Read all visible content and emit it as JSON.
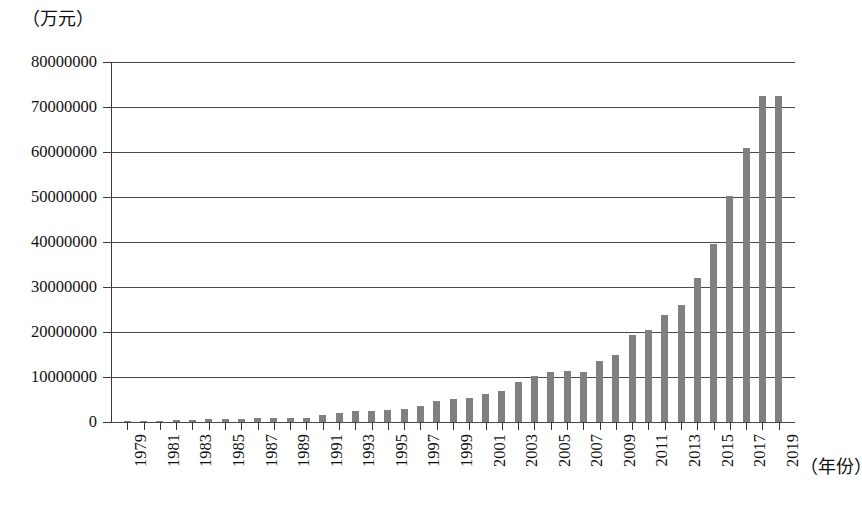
{
  "chart_data": {
    "type": "bar",
    "title": "",
    "subtitle": "",
    "ylabel": "（万元）",
    "xlabel": "（年份）",
    "ylim": [
      0,
      80000000
    ],
    "ytick_labels": [
      "80000000",
      "70000000",
      "60000000",
      "50000000",
      "40000000",
      "30000000",
      "20000000",
      "10000000",
      "0"
    ],
    "ytick_values": [
      80000000,
      70000000,
      60000000,
      50000000,
      40000000,
      30000000,
      20000000,
      10000000,
      0
    ],
    "grid": true,
    "legend": null,
    "bar_color": "#808080",
    "axis_color": "#3a3a3a",
    "grid_color": "#4a4a4a",
    "xtick_label_rotation": 90,
    "xtick_label_step": 2,
    "categories": [
      "1979",
      "1980",
      "1981",
      "1982",
      "1983",
      "1984",
      "1985",
      "1986",
      "1987",
      "1988",
      "1989",
      "1990",
      "1991",
      "1992",
      "1993",
      "1994",
      "1995",
      "1996",
      "1997",
      "1998",
      "1999",
      "2000",
      "2001",
      "2002",
      "2003",
      "2004",
      "2005",
      "2006",
      "2007",
      "2008",
      "2009",
      "2010",
      "2011",
      "2012",
      "2013",
      "2014",
      "2015",
      "2016",
      "2017",
      "2018",
      "2019"
    ],
    "visible_xtick_labels": [
      "1979",
      "1981",
      "1983",
      "1985",
      "1987",
      "1989",
      "1991",
      "1993",
      "1995",
      "1997",
      "1999",
      "2001",
      "2003",
      "2005",
      "2007",
      "2009",
      "2011",
      "2013",
      "2015",
      "2017",
      "2019"
    ],
    "values": [
      200000,
      250000,
      300000,
      350000,
      450000,
      600000,
      700000,
      750000,
      800000,
      900000,
      900000,
      950000,
      1500000,
      2000000,
      2400000,
      2500000,
      2600000,
      2900000,
      3500000,
      4700000,
      5200000,
      5400000,
      6200000,
      7000000,
      9000000,
      10300000,
      11200000,
      11400000,
      11200000,
      13500000,
      15000000,
      19300000,
      20400000,
      23700000,
      26100000,
      32000000,
      39600000,
      50200000,
      60900000,
      72500000,
      72500000
    ]
  }
}
